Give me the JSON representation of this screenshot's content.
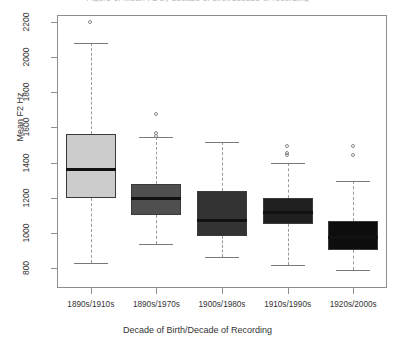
{
  "chart_data": {
    "type": "box",
    "title": "Figure 3. Mean F2 by decade of birth/decade of recording",
    "xlabel": "Decade of Birth/Decade of Recording",
    "ylabel": "Mean F2 Hz",
    "ylim": [
      740,
      2260
    ],
    "yticks": [
      800,
      1000,
      1200,
      1400,
      1600,
      1800,
      2000,
      2200
    ],
    "ytick_labels": [
      "800",
      "1000",
      "1200",
      "1400",
      "1600",
      "1800",
      "2000",
      "2200"
    ],
    "grid": false,
    "legend": "none",
    "categories": [
      "1890s/1910s",
      "1890s/1970s",
      "1900s/1980s",
      "1910s/1990s",
      "1920s/2000s"
    ],
    "boxes": [
      {
        "category": "1890s/1910s",
        "whisker_low": 830,
        "q1": 1200,
        "median": 1360,
        "q3": 1565,
        "whisker_high": 2080,
        "outliers": [
          2195
        ],
        "fill": "#cccccc"
      },
      {
        "category": "1890s/1970s",
        "whisker_low": 935,
        "q1": 1100,
        "median": 1195,
        "q3": 1280,
        "whisker_high": 1545,
        "outliers": [
          1675,
          1565,
          1550
        ],
        "fill": "#4f4f4f"
      },
      {
        "category": "1900s/1980s",
        "whisker_low": 860,
        "q1": 980,
        "median": 1070,
        "q3": 1240,
        "whisker_high": 1515,
        "outliers": [],
        "fill": "#333333"
      },
      {
        "category": "1910s/1990s",
        "whisker_low": 815,
        "q1": 1050,
        "median": 1115,
        "q3": 1200,
        "whisker_high": 1398,
        "outliers": [
          1490,
          1450,
          1440
        ],
        "fill": "#1f1f1f"
      },
      {
        "category": "1920s/2000s",
        "whisker_low": 790,
        "q1": 900,
        "median": 975,
        "q3": 1070,
        "whisker_high": 1295,
        "outliers": [
          1490,
          1440
        ],
        "fill": "#0d0d0d"
      }
    ]
  }
}
